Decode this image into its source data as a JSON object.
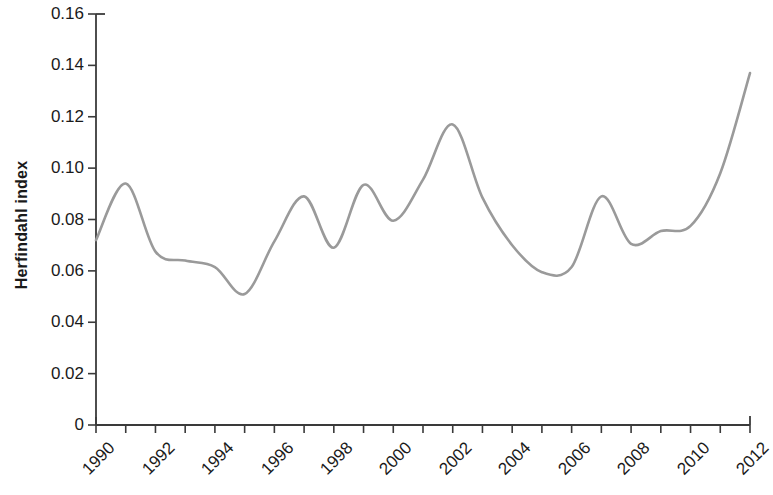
{
  "chart_data": {
    "type": "line",
    "title": "",
    "xlabel": "",
    "ylabel": "Herfindahl index",
    "xlim": [
      1990,
      2012
    ],
    "ylim": [
      0,
      0.16
    ],
    "grid": false,
    "legend": "none",
    "line_color": "#9a9a9a",
    "axis_color": "#3a3a3a",
    "x_tick_labels": [
      "1990",
      "1992",
      "1994",
      "1996",
      "1998",
      "2000",
      "2002",
      "2004",
      "2006",
      "2008",
      "2010",
      "2012"
    ],
    "x_tick_values": [
      1990,
      1992,
      1994,
      1996,
      1998,
      2000,
      2002,
      2004,
      2006,
      2008,
      2010,
      2012
    ],
    "x_minor_ticks": [
      1991,
      1993,
      1995,
      1997,
      1999,
      2001,
      2003,
      2005,
      2007,
      2009,
      2011
    ],
    "y_tick_labels": [
      "0",
      "0.02",
      "0.04",
      "0.06",
      "0.08",
      "0.10",
      "0.12",
      "0.14",
      "0.16"
    ],
    "y_tick_values": [
      0,
      0.02,
      0.04,
      0.06,
      0.08,
      0.1,
      0.12,
      0.14,
      0.16
    ],
    "x": [
      1990,
      1991,
      1992,
      1993,
      1994,
      1995,
      1996,
      1997,
      1998,
      1999,
      2000,
      2001,
      2002,
      2003,
      2004,
      2005,
      2006,
      2007,
      2008,
      2009,
      2010,
      2011,
      2012
    ],
    "values": [
      0.072,
      0.094,
      0.0675,
      0.064,
      0.0615,
      0.051,
      0.0715,
      0.089,
      0.069,
      0.0935,
      0.0795,
      0.0955,
      0.117,
      0.0885,
      0.07,
      0.0595,
      0.0615,
      0.089,
      0.0705,
      0.0755,
      0.0775,
      0.098,
      0.137
    ],
    "series": [
      {
        "name": "Herfindahl index",
        "values": [
          0.072,
          0.094,
          0.0675,
          0.064,
          0.0615,
          0.051,
          0.0715,
          0.089,
          0.069,
          0.0935,
          0.0795,
          0.0955,
          0.117,
          0.0885,
          0.07,
          0.0595,
          0.0615,
          0.089,
          0.0705,
          0.0755,
          0.0775,
          0.098,
          0.137
        ]
      }
    ]
  }
}
